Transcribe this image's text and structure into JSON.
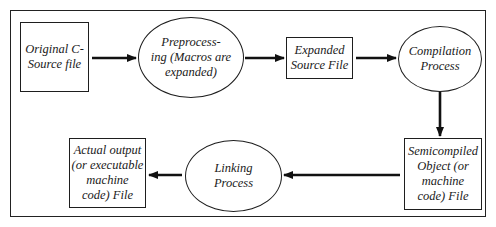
{
  "diagram": {
    "type": "flowchart",
    "nodes": [
      {
        "id": "source",
        "shape": "rectangle",
        "label": "Original C-\nSource file"
      },
      {
        "id": "preprocess",
        "shape": "ellipse",
        "label": "Preprocess-\ning (Macros are\nexpanded)"
      },
      {
        "id": "expanded",
        "shape": "rectangle",
        "label": "Expanded\nSource File"
      },
      {
        "id": "compile",
        "shape": "ellipse",
        "label": "Compilation\nProcess"
      },
      {
        "id": "object",
        "shape": "rectangle",
        "label": "Semicompiled\nObject (or\nmachine\ncode) File"
      },
      {
        "id": "link",
        "shape": "ellipse",
        "label": "Linking\nProcess"
      },
      {
        "id": "output",
        "shape": "rectangle",
        "label": "Actual output\n(or executable\nmachine\ncode) File"
      }
    ],
    "edges": [
      {
        "from": "source",
        "to": "preprocess"
      },
      {
        "from": "preprocess",
        "to": "expanded"
      },
      {
        "from": "expanded",
        "to": "compile"
      },
      {
        "from": "compile",
        "to": "object"
      },
      {
        "from": "object",
        "to": "link"
      },
      {
        "from": "link",
        "to": "output"
      }
    ]
  }
}
